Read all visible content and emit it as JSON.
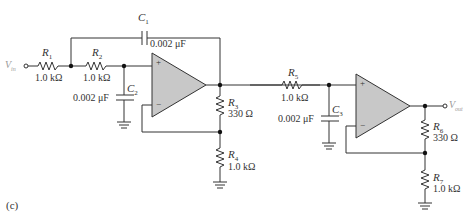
{
  "figure_label": "(c)",
  "colors": {
    "wire": "#333333",
    "opamp_fill": "#c8c8c8",
    "terminal_text": "#9a9a9a"
  },
  "terminals": {
    "input": {
      "label": "V",
      "sub": "in"
    },
    "output": {
      "label": "V",
      "sub": "out"
    }
  },
  "components": {
    "R1": {
      "name": "R",
      "sub": "1",
      "value": "1.0 kΩ"
    },
    "R2": {
      "name": "R",
      "sub": "2",
      "value": "1.0 kΩ"
    },
    "C1": {
      "name": "C",
      "sub": "1",
      "value": "0.002 μF"
    },
    "C2": {
      "name": "C",
      "sub": "2",
      "value": "0.002 μF"
    },
    "R3": {
      "name": "R",
      "sub": "3",
      "value": "330 Ω"
    },
    "R4": {
      "name": "R",
      "sub": "4",
      "value": "1.0 kΩ"
    },
    "R5": {
      "name": "R",
      "sub": "5",
      "value": "1.0 kΩ"
    },
    "C3": {
      "name": "C",
      "sub": "3",
      "value": "0.002 μF"
    },
    "R6": {
      "name": "R",
      "sub": "6",
      "value": "330 Ω"
    },
    "R7": {
      "name": "R",
      "sub": "7",
      "value": "1.0 kΩ"
    }
  },
  "opamps": [
    {
      "plus": "+",
      "minus": "−"
    },
    {
      "plus": "+",
      "minus": "−"
    }
  ]
}
